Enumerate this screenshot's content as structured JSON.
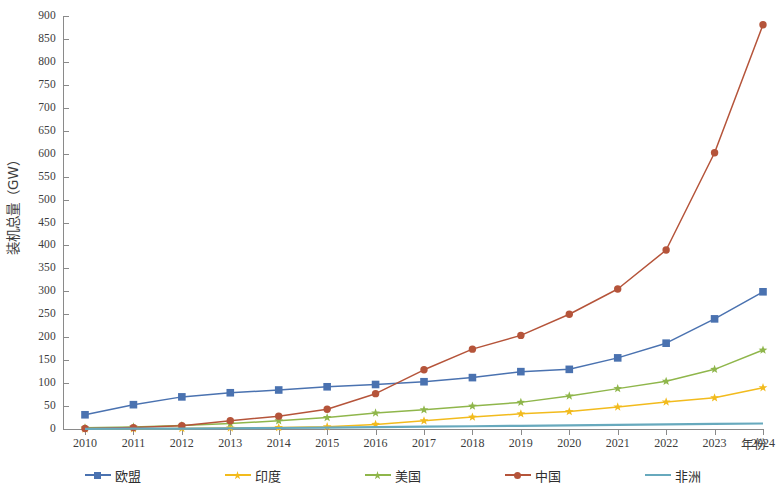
{
  "chart_data": {
    "type": "line",
    "title": "",
    "xlabel": "年份",
    "ylabel": "装机总量（GW）",
    "categories": [
      "2010",
      "2011",
      "2012",
      "2013",
      "2014",
      "2015",
      "2016",
      "2017",
      "2018",
      "2019",
      "2020",
      "2021",
      "2022",
      "2023",
      "2024"
    ],
    "x": [
      2010,
      2011,
      2012,
      2013,
      2014,
      2015,
      2016,
      2017,
      2018,
      2019,
      2020,
      2021,
      2022,
      2023,
      2024
    ],
    "ylim": [
      0,
      900
    ],
    "yticks": [
      0,
      50,
      100,
      150,
      200,
      250,
      300,
      350,
      400,
      450,
      500,
      550,
      600,
      650,
      700,
      750,
      800,
      850,
      900
    ],
    "grid": false,
    "legend_position": "bottom",
    "series": [
      {
        "name": "欧盟",
        "color": "#4a72b0",
        "marker": "square",
        "values": [
          31,
          53,
          70,
          79,
          85,
          92,
          97,
          103,
          112,
          125,
          130,
          155,
          187,
          240,
          299
        ]
      },
      {
        "name": "印度",
        "color": "#f2bb1d",
        "marker": "star",
        "values": [
          0.2,
          0.5,
          1.2,
          2.3,
          3.2,
          5,
          10,
          18,
          26,
          33,
          38,
          48,
          59,
          68,
          90
        ]
      },
      {
        "name": "美国",
        "color": "#8fb64b",
        "marker": "star",
        "values": [
          2.5,
          4.5,
          7.5,
          12,
          18,
          25,
          35,
          42,
          50,
          58,
          72,
          88,
          104,
          130,
          172
        ]
      },
      {
        "name": "中国",
        "color": "#b5543a",
        "marker": "circle",
        "values": [
          1,
          3,
          7,
          18,
          28,
          43,
          77,
          129,
          174,
          204,
          250,
          305,
          390,
          602,
          881
        ]
      },
      {
        "name": "非洲",
        "color": "#67a9bd",
        "marker": "none",
        "values": [
          0.3,
          0.6,
          1,
          1.6,
          2.2,
          3,
          4,
          5,
          6,
          7,
          8,
          9,
          10,
          11,
          12
        ]
      }
    ]
  },
  "legend": {
    "items": [
      {
        "label": "欧盟",
        "color": "#4a72b0"
      },
      {
        "label": "印度",
        "color": "#f2bb1d"
      },
      {
        "label": "美国",
        "color": "#8fb64b"
      },
      {
        "label": "中国",
        "color": "#b5543a"
      },
      {
        "label": "非洲",
        "color": "#67a9bd"
      }
    ]
  }
}
